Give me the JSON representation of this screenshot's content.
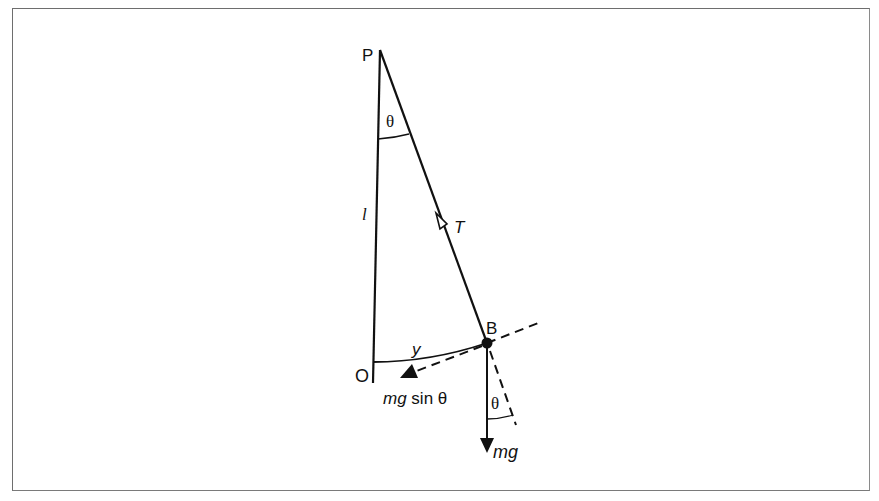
{
  "diagram": {
    "labels": {
      "pivot": "P",
      "origin": "O",
      "bob": "B",
      "length": "l",
      "tension": "T",
      "displacement": "y",
      "angle_top": "θ",
      "angle_bottom": "θ",
      "weight": "mg",
      "restoring_force_mg": "mg",
      "restoring_force_sin": " sin θ"
    },
    "colors": {
      "ink": "#111111",
      "frame": "#6e6e6e",
      "background": "#ffffff"
    }
  }
}
